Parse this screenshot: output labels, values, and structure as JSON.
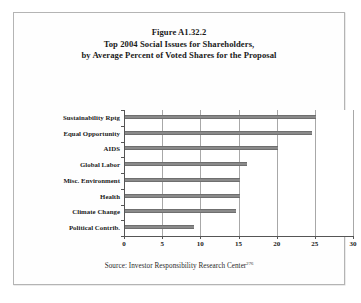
{
  "figure": {
    "title_lines": [
      "Figure A1.32.2",
      "Top 2004 Social Issues for Shareholders,",
      "by Average Percent of Voted Shares for the Proposal"
    ],
    "source_text": "Source: Investor Responsibility Research Center",
    "source_superscript": "276",
    "bar_color": "#8a8a8a",
    "grid_color": "#a8a8a8",
    "axis_color": "#555555",
    "background_color": "#ffffff",
    "border_color": "#b4b4b4"
  },
  "chart_data": {
    "type": "bar",
    "orientation": "horizontal",
    "xlabel": "",
    "ylabel": "",
    "categories": [
      "Sustainability Rptg",
      "Equal Opportunity",
      "AIDS",
      "Global Labor",
      "Misc. Environment",
      "Health",
      "Climate Change",
      "Political Contrib."
    ],
    "values": [
      25,
      24.5,
      20,
      16,
      15,
      15,
      14.5,
      9
    ],
    "xlim": [
      0,
      30
    ],
    "xticks": [
      0,
      5,
      10,
      15,
      20,
      25,
      30
    ],
    "xtick_labels": [
      "0",
      "5",
      "10",
      "15",
      "20",
      "25",
      "30"
    ],
    "grid": true,
    "grid_axis": "x",
    "legend": false,
    "series": [
      {
        "name": "Average Percent of Voted Shares",
        "values": [
          25,
          24.5,
          20,
          16,
          15,
          15,
          14.5,
          9
        ]
      }
    ]
  }
}
